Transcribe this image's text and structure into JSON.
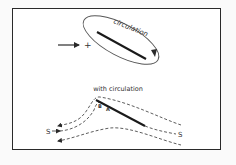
{
  "figure": {
    "top_panel": {
      "circulation_label": "circulation",
      "freestream_sign": "+"
    },
    "bottom_panel": {
      "title": "with circulation",
      "point_labels": {
        "B": "B",
        "A": "A"
      },
      "stagnation_labels": {
        "left": "S",
        "right": "S"
      }
    }
  },
  "colors": {
    "ink": "#2a2a2a",
    "background": "#ffffff"
  }
}
